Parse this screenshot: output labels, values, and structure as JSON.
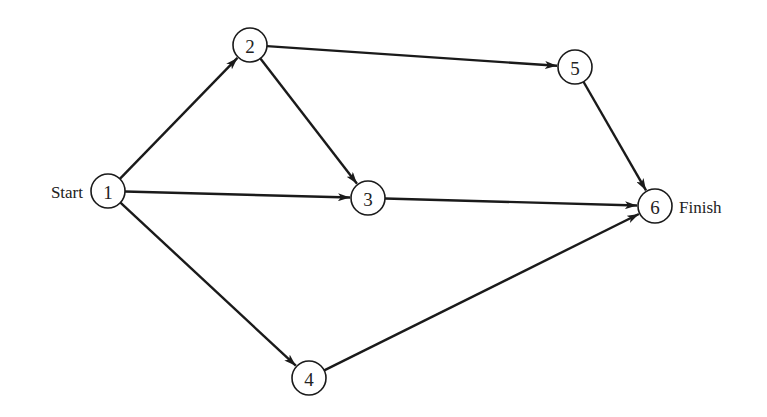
{
  "diagram": {
    "type": "activity-on-node network",
    "node_radius": 17,
    "nodes": [
      {
        "id": "1",
        "label": "1",
        "x": 108,
        "y": 191,
        "side_label": "Start",
        "side": "left"
      },
      {
        "id": "2",
        "label": "2",
        "x": 250,
        "y": 45
      },
      {
        "id": "3",
        "label": "3",
        "x": 368,
        "y": 198
      },
      {
        "id": "4",
        "label": "4",
        "x": 309,
        "y": 378
      },
      {
        "id": "5",
        "label": "5",
        "x": 575,
        "y": 67
      },
      {
        "id": "6",
        "label": "6",
        "x": 655,
        "y": 206,
        "side_label": "Finish",
        "side": "right"
      }
    ],
    "edges": [
      {
        "from": "1",
        "to": "2"
      },
      {
        "from": "1",
        "to": "3"
      },
      {
        "from": "1",
        "to": "4"
      },
      {
        "from": "2",
        "to": "3"
      },
      {
        "from": "2",
        "to": "5"
      },
      {
        "from": "3",
        "to": "6"
      },
      {
        "from": "4",
        "to": "6"
      },
      {
        "from": "5",
        "to": "6"
      }
    ],
    "colors": {
      "stroke": "#1a1a1a",
      "background": "#ffffff",
      "text": "#222222"
    }
  }
}
